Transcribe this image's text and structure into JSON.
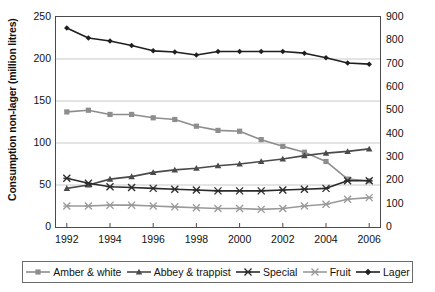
{
  "chart_data": {
    "type": "line",
    "title": "",
    "xlabel": "",
    "ylabel": "Consumption non-lager (million litres)",
    "ylabel_right": "Consumption lager (million litres)",
    "x": [
      1992,
      1993,
      1994,
      1995,
      1996,
      1997,
      1998,
      1999,
      2000,
      2001,
      2002,
      2003,
      2004,
      2005,
      2006
    ],
    "xlim": [
      1991.5,
      2006.5
    ],
    "xticks": [
      "1992",
      "1994",
      "1996",
      "1998",
      "2000",
      "2002",
      "2004",
      "2006"
    ],
    "xtick_values": [
      1992,
      1994,
      1996,
      1998,
      2000,
      2002,
      2004,
      2006
    ],
    "ylim": [
      0,
      250
    ],
    "yticks": [
      "0",
      "50",
      "100",
      "150",
      "200",
      "250"
    ],
    "ytick_values": [
      0,
      50,
      100,
      150,
      200,
      250
    ],
    "ylim_right": [
      0,
      900
    ],
    "yticks_right": [
      "0",
      "100",
      "200",
      "300",
      "400",
      "500",
      "600",
      "700",
      "800",
      "900"
    ],
    "ytick_values_right": [
      0,
      100,
      200,
      300,
      400,
      500,
      600,
      700,
      800,
      900
    ],
    "grid": "horizontal",
    "legend_position": "below",
    "series": [
      {
        "name": "Amber & white",
        "axis": "left",
        "marker": "square",
        "color": "#8d8d8d",
        "values": [
          137,
          139,
          134,
          134,
          130,
          128,
          120,
          115,
          114,
          104,
          96,
          89,
          78,
          57,
          55
        ]
      },
      {
        "name": "Abbey & trappist",
        "axis": "left",
        "marker": "triangle",
        "color": "#4a4a4a",
        "values": [
          46,
          50,
          57,
          60,
          65,
          68,
          70,
          73,
          75,
          78,
          81,
          85,
          88,
          90,
          93
        ]
      },
      {
        "name": "Special",
        "axis": "left",
        "marker": "star",
        "color": "#2b2b2b",
        "values": [
          58,
          52,
          48,
          47,
          46,
          45,
          44,
          43,
          43,
          43,
          44,
          45,
          46,
          55,
          55
        ]
      },
      {
        "name": "Fruit",
        "axis": "left",
        "marker": "star",
        "color": "#9a9a9a",
        "values": [
          25,
          25,
          26,
          26,
          25,
          24,
          23,
          22,
          22,
          21,
          22,
          25,
          27,
          33,
          35
        ]
      },
      {
        "name": "Lager",
        "axis": "right",
        "marker": "diamond",
        "color": "#1f1f1f",
        "values": [
          853,
          810,
          797,
          778,
          755,
          750,
          737,
          752,
          752,
          752,
          752,
          745,
          725,
          703,
          698
        ]
      }
    ]
  }
}
